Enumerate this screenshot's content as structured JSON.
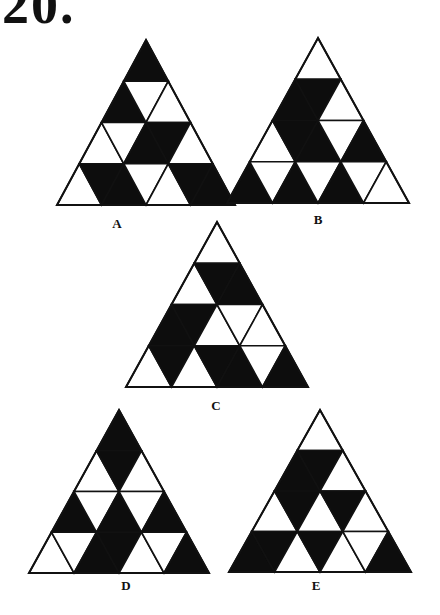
{
  "heading": "20.",
  "colors": {
    "fill": "#0d0d0d",
    "empty": "#ffffff",
    "stroke": "#111111"
  },
  "figures": [
    {
      "label": "A",
      "apex": [
        146,
        40
      ],
      "width": 178,
      "height": 165,
      "label_pos": [
        117,
        216
      ],
      "rows": [
        [
          "B"
        ],
        [
          "B",
          "W",
          "W"
        ],
        [
          "W",
          "W",
          "B",
          "B",
          "W"
        ],
        [
          "W",
          "B",
          "B",
          "W",
          "W",
          "B",
          "B"
        ]
      ]
    },
    {
      "label": "B",
      "apex": [
        318,
        38
      ],
      "width": 182,
      "height": 165,
      "label_pos": [
        318,
        212
      ],
      "rows": [
        [
          "W"
        ],
        [
          "B",
          "B",
          "W"
        ],
        [
          "W",
          "B",
          "B",
          "W",
          "B"
        ],
        [
          "B",
          "W",
          "B",
          "W",
          "B",
          "W",
          "W"
        ]
      ]
    },
    {
      "label": "C",
      "apex": [
        217,
        222
      ],
      "width": 182,
      "height": 165,
      "label_pos": [
        216,
        398
      ],
      "rows": [
        [
          "W"
        ],
        [
          "W",
          "B",
          "B"
        ],
        [
          "B",
          "B",
          "W",
          "W",
          "W"
        ],
        [
          "W",
          "B",
          "W",
          "B",
          "B",
          "W",
          "B"
        ]
      ]
    },
    {
      "label": "D",
      "apex": [
        119,
        410
      ],
      "width": 180,
      "height": 163,
      "label_pos": [
        126,
        578
      ],
      "rows": [
        [
          "B"
        ],
        [
          "W",
          "B",
          "W"
        ],
        [
          "B",
          "W",
          "B",
          "W",
          "B"
        ],
        [
          "W",
          "W",
          "B",
          "B",
          "W",
          "W",
          "B"
        ]
      ]
    },
    {
      "label": "E",
      "apex": [
        320,
        410
      ],
      "width": 182,
      "height": 162,
      "label_pos": [
        316,
        578
      ],
      "rows": [
        [
          "W"
        ],
        [
          "B",
          "B",
          "W"
        ],
        [
          "W",
          "B",
          "W",
          "B",
          "W"
        ],
        [
          "B",
          "B",
          "W",
          "B",
          "W",
          "W",
          "B"
        ]
      ]
    }
  ]
}
